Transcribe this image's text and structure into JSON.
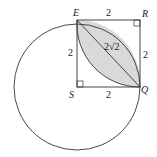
{
  "diagram": {
    "points": {
      "E": "E",
      "R": "R",
      "S": "S",
      "Q": "Q"
    },
    "side_labels": {
      "top": "2",
      "left": "2",
      "right": "2",
      "bottom": "2",
      "diagonal": "2√2"
    },
    "colors": {
      "stroke": "#333333",
      "shade": "#d9d9d9",
      "background": "#ffffff"
    }
  }
}
